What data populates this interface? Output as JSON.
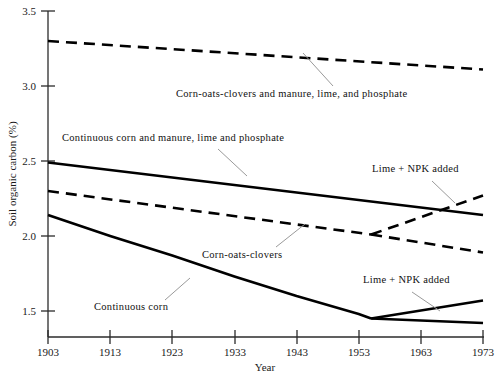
{
  "chart_data": {
    "type": "line",
    "title": "",
    "xlabel": "Year",
    "ylabel": "Soil organic carbon (%)",
    "xlim": [
      1903,
      1973
    ],
    "ylim": [
      1.35,
      3.5
    ],
    "grid": false,
    "legend_position": "inline-annotations",
    "xticks": [
      1903,
      1913,
      1923,
      1933,
      1943,
      1953,
      1963,
      1973
    ],
    "yticks": [
      1.5,
      2.0,
      2.5,
      3.0,
      3.5
    ],
    "ytick_labels": [
      "1.5",
      "2.0",
      "2.5",
      "3.0",
      "3.5"
    ],
    "xtick_labels": [
      "1903",
      "1913",
      "1923",
      "1933",
      "1943",
      "1953",
      "1963",
      "1973"
    ],
    "series": [
      {
        "name": "Corn-oats-clovers and manure, lime, and phosphate",
        "style": "dashed",
        "x": [
          1903,
          1973
        ],
        "values": [
          3.3,
          3.11
        ]
      },
      {
        "name": "Continuous corn and manure, lime and phosphate",
        "style": "solid",
        "x": [
          1903,
          1973
        ],
        "values": [
          2.49,
          2.14
        ]
      },
      {
        "name": "Corn-oats-clovers",
        "style": "dashed",
        "x": [
          1903,
          1955
        ],
        "values": [
          2.3,
          2.01
        ]
      },
      {
        "name": "Corn-oats-clovers, Lime + NPK added",
        "style": "dashed",
        "x": [
          1955,
          1973
        ],
        "values": [
          2.01,
          2.27
        ]
      },
      {
        "name": "Corn-oats-clovers, untreated continuation",
        "style": "dashed",
        "x": [
          1955,
          1973
        ],
        "values": [
          2.01,
          1.89
        ]
      },
      {
        "name": "Continuous corn",
        "style": "solid",
        "x": [
          1903,
          1913,
          1923,
          1933,
          1943,
          1953,
          1955
        ],
        "values": [
          2.14,
          2.0,
          1.87,
          1.73,
          1.6,
          1.48,
          1.45
        ]
      },
      {
        "name": "Continuous corn, Lime + NPK added",
        "style": "solid",
        "x": [
          1955,
          1973
        ],
        "values": [
          1.45,
          1.57
        ]
      },
      {
        "name": "Continuous corn, untreated continuation",
        "style": "solid",
        "x": [
          1955,
          1973
        ],
        "values": [
          1.45,
          1.42
        ]
      }
    ],
    "annotations": [
      {
        "text": "Corn-oats-clovers and manure, lime, and phosphate",
        "x": 176,
        "y": 97
      },
      {
        "text": "Continuous corn and manure, lime and phosphate",
        "x": 62,
        "y": 141
      },
      {
        "text": "Corn-oats-clovers",
        "x": 202,
        "y": 258
      },
      {
        "text": "Lime + NPK added",
        "x": 372,
        "y": 172
      },
      {
        "text": "Lime + NPK added",
        "x": 363,
        "y": 283
      },
      {
        "text": "Continuous corn",
        "x": 94,
        "y": 310
      }
    ],
    "colors": {
      "line": "#000000",
      "leader": "#9a9a9a",
      "axis": "#2b2b2b",
      "text": "#111111"
    }
  }
}
